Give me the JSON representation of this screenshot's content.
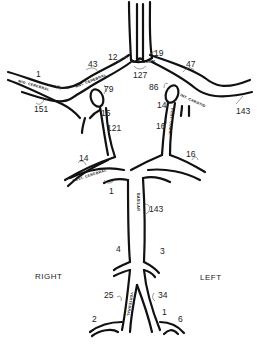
{
  "diagram": {
    "orientation": {
      "right": "RIGHT",
      "left": "LEFT"
    },
    "vessel_labels": {
      "mid_cerebral": "MID. CEREBRAL",
      "ant_cerebral": "ANT. CEREBRAL",
      "ant_comm": "ANT. COMM.",
      "int_carotid": "INT. CAROTID",
      "post_comm": "POST. COMM.",
      "post_cerebral": "POST. CEREBRAL",
      "basilar": "BASILAR",
      "vertebral": "VERTEBRAL"
    },
    "measurements": {
      "right_mid_cerebral_proximal": "1",
      "right_mid_cerebral": "151",
      "right_ant_cerebral": "43",
      "right_ant_cerebral_distal": "12",
      "left_ant_cerebral_distal": "19",
      "left_ant_cerebral": "47",
      "ant_comm": "127",
      "right_int_carotid": "79",
      "right_int_carotid_base": "15",
      "right_post_comm": "121",
      "left_int_carotid": "86",
      "left_int_carotid_base": "14",
      "left_post_comm": "16",
      "left_mid_cerebral": "143",
      "right_post_cerebral": "14",
      "left_post_cerebral": "16",
      "basilar_top": "1",
      "basilar": "143",
      "right_branch_upper": "4",
      "left_branch_upper": "3",
      "right_vertebral": "25",
      "left_vertebral": "34",
      "right_branch_lower": "2",
      "left_branch_mid": "1",
      "left_branch_lower": "6"
    }
  }
}
